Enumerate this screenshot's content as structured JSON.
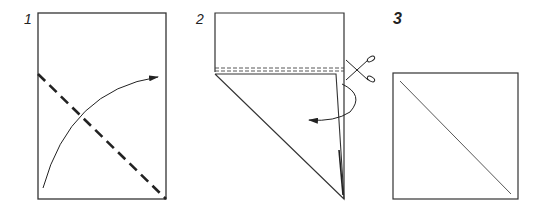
{
  "diagram": {
    "type": "origami folding instructions",
    "steps": [
      {
        "number": "1",
        "description": "Rectangle with diagonal dashed fold line and curved arrow (fold corner over)"
      },
      {
        "number": "2",
        "description": "Folded shape with double dashed cut line and scissors, curved arrow indicating fold behind"
      },
      {
        "number": "3",
        "description": "Resulting square with diagonal crease"
      }
    ]
  },
  "colors": {
    "line": "#333333",
    "background": "#ffffff"
  }
}
